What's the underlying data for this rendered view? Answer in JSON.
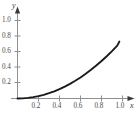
{
  "chart_data": {
    "type": "line",
    "title": "",
    "subtitle": "",
    "xlabel": "x",
    "ylabel": "y",
    "xlim": [
      0,
      1.08
    ],
    "ylim": [
      0,
      1.08
    ],
    "xticks": [
      0.2,
      0.4,
      0.6,
      0.8,
      1.0
    ],
    "xtick_labels": [
      "0.2",
      "0.4",
      "0.6",
      "0.8",
      "1.0"
    ],
    "yticks": [
      0.2,
      0.4,
      0.6,
      0.8,
      1.0
    ],
    "ytick_labels": [
      "0.2",
      "0.4",
      "0.6",
      "0.8",
      "1.0"
    ],
    "grid": false,
    "legend": null,
    "legend_position": "none",
    "annotations": [],
    "axis_color": "#8a8a8a",
    "curve_color": "#1a1a1a",
    "background_color": "#ffffff",
    "series": [
      {
        "name": "curve",
        "color": "#1a1a1a",
        "x": [
          0.0,
          0.05,
          0.1,
          0.15,
          0.2,
          0.25,
          0.3,
          0.35,
          0.4,
          0.45,
          0.5,
          0.55,
          0.6,
          0.65,
          0.7,
          0.75,
          0.8,
          0.85,
          0.9,
          0.95,
          0.97
        ],
        "y": [
          0.0,
          0.002,
          0.008,
          0.017,
          0.03,
          0.047,
          0.068,
          0.092,
          0.12,
          0.152,
          0.188,
          0.227,
          0.27,
          0.317,
          0.368,
          0.422,
          0.48,
          0.542,
          0.608,
          0.677,
          0.73
        ]
      }
    ]
  },
  "axis_labels": {
    "x": "x",
    "y": "y"
  }
}
